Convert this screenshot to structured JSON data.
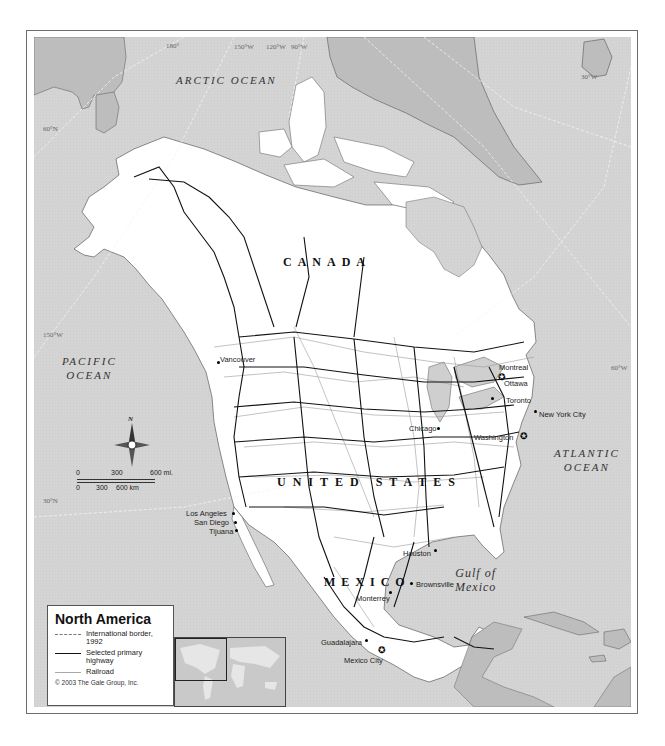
{
  "map": {
    "title": "North America",
    "ocean_labels": [
      {
        "id": "arctic",
        "text": "ARCTIC OCEAN"
      },
      {
        "id": "pacific",
        "line1": "PACIFIC",
        "line2": "OCEAN"
      },
      {
        "id": "atlantic",
        "line1": "ATLANTIC",
        "line2": "OCEAN"
      },
      {
        "id": "gulf",
        "line1": "Gulf of",
        "line2": "Mexico"
      }
    ],
    "country_labels": {
      "canada": "CANADA",
      "united_states": "UNITED STATES",
      "mexico": "MEXICO"
    },
    "graticule_labels": {
      "lon_180": "180°",
      "lon_150w_top": "150°W",
      "lon_120w": "120°W",
      "lon_90w": "90°W",
      "lon_30w": "30°W",
      "lat_60n": "60°N",
      "lon_150w_left": "150°W",
      "lon_60w": "60°W",
      "lat_30n": "30°N"
    },
    "cities": {
      "vancouver": "Vancouver",
      "montreal": "Montreal",
      "ottawa": "Ottawa",
      "toronto": "Toronto",
      "new_york": "New York City",
      "chicago": "Chicago",
      "washington": "Washington",
      "los_angeles": "Los Angeles",
      "san_diego": "San Diego",
      "tijuana": "Tijuana",
      "houston": "Houston",
      "brownsville": "Brownsville",
      "monterrey": "Monterrey",
      "guadalajara": "Guadalajara",
      "mexico_city": "Mexico City"
    },
    "compass": {
      "north_label": "N",
      "icon": "compass-rose-icon"
    },
    "scale_bar": {
      "miles": {
        "ticks": [
          "0",
          "300",
          "600 mi."
        ]
      },
      "km": {
        "ticks": [
          "0",
          "300",
          "600 km"
        ]
      }
    }
  },
  "legend": {
    "title": "North America",
    "items": [
      {
        "symbol": "dash-dot-line",
        "label": "International border, 1992"
      },
      {
        "symbol": "thick-solid-line",
        "label": "Selected primary highway"
      },
      {
        "symbol": "thin-gray-line",
        "label": "Railroad"
      }
    ],
    "copyright": "© 2003 The Gale Group, Inc."
  },
  "colors": {
    "ocean": "#d6d6d6",
    "land_na": "#ffffff",
    "land_other": "#b9b9b9",
    "highway": "#111111",
    "railroad": "#9a9a9a",
    "frame": "#6e6e6e"
  }
}
